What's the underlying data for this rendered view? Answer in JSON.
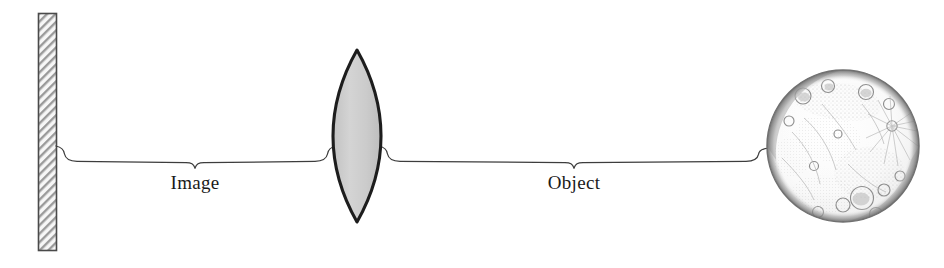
{
  "diagram": {
    "background_color": "#ffffff",
    "width": 944,
    "height": 268,
    "elements": {
      "screen": {
        "name": "image-screen",
        "description": "hatched vertical screen where image is formed",
        "fill_color": "#f2f2f2",
        "stroke_color": "#4a4a4a",
        "hatch_color": "#8d8d8d",
        "x": 38,
        "y": 13,
        "width": 19,
        "height": 238
      },
      "lens": {
        "name": "convex-lens",
        "description": "biconvex converging lens",
        "fill_color": "#cfcfcf",
        "stroke_color": "#1d1d1d",
        "center_x": 357,
        "center_y": 136,
        "half_width": 24,
        "half_height": 86
      },
      "moon": {
        "name": "moon-object",
        "description": "moon serving as the distant object",
        "center_x": 843,
        "center_y": 146,
        "radius": 76,
        "rim_color": "#8e8e8e",
        "body_color": "#fbfbfb",
        "mare_color": "#c9c9c9"
      },
      "image_brace": {
        "name": "image-distance-brace",
        "left_x": 55,
        "right_x": 336,
        "tip_x": 195,
        "top_y": 147,
        "tip_y": 168
      },
      "object_brace": {
        "name": "object-distance-brace",
        "left_x": 379,
        "right_x": 769,
        "tip_x": 574,
        "top_y": 147,
        "tip_y": 168
      }
    },
    "labels": [
      {
        "id": "image-label",
        "text": "Image",
        "x": 195,
        "y": 189,
        "font_size": 19
      },
      {
        "id": "object-label",
        "text": "Object",
        "x": 574,
        "y": 189,
        "font_size": 19
      }
    ]
  }
}
